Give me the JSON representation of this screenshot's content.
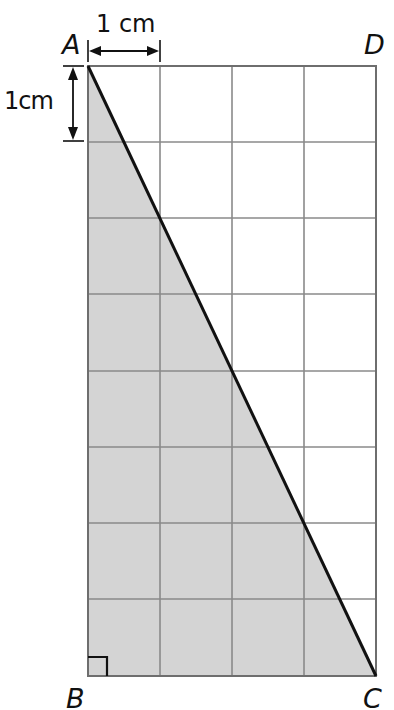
{
  "figure": {
    "type": "geometry-diagram",
    "grid": {
      "columns": 4,
      "rows": 8,
      "cell_size_label": "1 cm",
      "line_color": "#8a8a8a",
      "border_color": "#6e6e6e"
    },
    "rectangle": {
      "name": "ABCD",
      "vertices": {
        "A": {
          "label": "A"
        },
        "B": {
          "label": "B"
        },
        "C": {
          "label": "C"
        },
        "D": {
          "label": "D"
        }
      }
    },
    "triangle": {
      "name": "ABC",
      "vertices": [
        "A",
        "B",
        "C"
      ],
      "fill_color": "#d4d4d4",
      "right_angle_at": "B",
      "hypotenuse": "AC",
      "hypotenuse_color": "#111111"
    },
    "dimensions": {
      "horizontal": {
        "label": "1 cm"
      },
      "vertical": {
        "label": "1cm"
      }
    }
  }
}
